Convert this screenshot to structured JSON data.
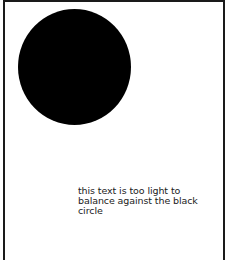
{
  "figure": {
    "caption_lines": [
      "this text is too light to",
      "balance against the black",
      "circle"
    ],
    "shape": "black-circle",
    "colors": {
      "circle": "#000000",
      "border": "#1a1a1a",
      "background": "#ffffff"
    }
  }
}
